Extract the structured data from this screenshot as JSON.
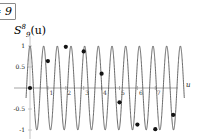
{
  "window": {
    "corner_field": {
      "name": "parameter-field",
      "value": "= 9"
    }
  },
  "figure": {
    "title_base": "S",
    "title_sub": "9",
    "title_sup": "8",
    "title_arg": "(u)",
    "title_full": "S_9^8(u)",
    "x_axis_name": "u",
    "y_ticks": [
      "1",
      "0.5",
      "-0.5",
      "-1"
    ],
    "x_ticks": [
      "1",
      "2",
      "3",
      "4",
      "5",
      "6",
      "7"
    ],
    "colors": {
      "curve": "#4d4d4d",
      "axis": "#9a9a9a",
      "marker": "#141414",
      "frame": "#8a8a8a",
      "background": "#ffffff"
    }
  },
  "chart_data": {
    "type": "line",
    "xlabel": "u",
    "ylabel": "",
    "xlim": [
      -0.25,
      8.6
    ],
    "ylim": [
      -1.15,
      1.15
    ],
    "grid": false,
    "legend": false,
    "series": [
      {
        "name": "continuous-waveform",
        "kind": "line",
        "description": "high frequency sinusoid cos(2*pi*8*u/9) sampled form",
        "formula": "cos(2*pi*(8/9)*9*u/9)",
        "frequency_cycles_over_range": 11,
        "amplitude": 1,
        "color": "#4d4d4d"
      },
      {
        "name": "sample-points",
        "kind": "scatter",
        "color": "#141414",
        "x": [
          0,
          1,
          2,
          3,
          4,
          5,
          6,
          7,
          8
        ],
        "y": [
          0.0,
          0.64,
          0.98,
          0.87,
          0.34,
          -0.34,
          -0.87,
          -0.98,
          -0.64
        ]
      }
    ],
    "x_tick_values": [
      1,
      2,
      3,
      4,
      5,
      6,
      7
    ],
    "y_tick_values": [
      1,
      0.5,
      -0.5,
      -1
    ]
  }
}
